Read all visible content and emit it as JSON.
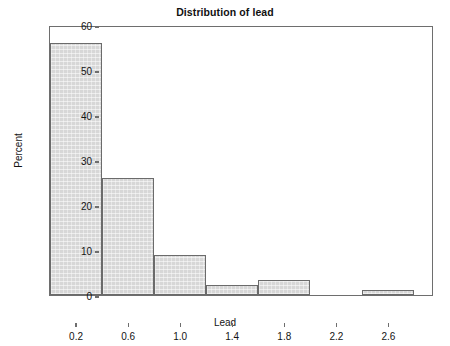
{
  "chart_data": {
    "type": "bar",
    "title": "Distribution of lead",
    "xlabel": "Lead",
    "ylabel": "Percent",
    "grid": false,
    "legend": false,
    "bin_width": 0.4,
    "bin_edges": [
      0.0,
      0.4,
      0.8,
      1.2,
      1.6,
      2.0,
      2.4,
      2.8
    ],
    "categories": [
      "0.0-0.4",
      "0.4-0.8",
      "0.8-1.2",
      "1.2-1.6",
      "1.6-2.0",
      "2.0-2.4",
      "2.4-2.8"
    ],
    "bin_centers": [
      0.2,
      0.6,
      1.0,
      1.4,
      1.8,
      2.2,
      2.6
    ],
    "values": [
      56.0,
      26.0,
      8.8,
      2.2,
      3.3,
      0.0,
      1.1
    ],
    "xlim": [
      0.0,
      2.95
    ],
    "ylim": [
      0,
      60
    ],
    "xticks": [
      0.2,
      0.6,
      1.0,
      1.4,
      1.8,
      2.2,
      2.6
    ],
    "xtick_labels": [
      "0.2",
      "0.6",
      "1.0",
      "1.4",
      "1.8",
      "2.2",
      "2.6"
    ],
    "yticks": [
      0,
      10,
      20,
      30,
      40,
      50,
      60
    ],
    "ytick_labels": [
      "0",
      "10",
      "20",
      "30",
      "40",
      "50",
      "60"
    ],
    "bar_fill_color": "#d7d7d7",
    "bar_edge_color": "#6b6b6b",
    "axis_color": "#6e6e6e",
    "background_color": "#ffffff"
  }
}
